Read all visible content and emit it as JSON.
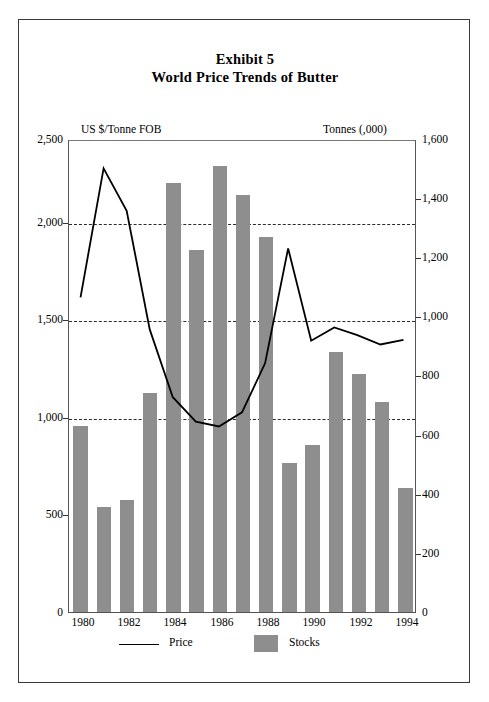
{
  "title": {
    "line1": "Exhibit 5",
    "line2": "World Price Trends of Butter"
  },
  "legend": {
    "price_label": "Price",
    "stocks_label": "Stocks"
  },
  "axes": {
    "left_title": "US $/Tonne FOB",
    "right_title": "Tonnes (,000)",
    "left_ticks": [
      "2,500",
      "2,000",
      "1,500",
      "1,000",
      "500",
      "0"
    ],
    "right_ticks": [
      "1,600",
      "1,400",
      "1,200",
      "1,000",
      "800",
      "600",
      "400",
      "200",
      "0"
    ],
    "x_ticks": [
      "1980",
      "1982",
      "1984",
      "1986",
      "1988",
      "1990",
      "1992",
      "1994"
    ]
  },
  "colors": {
    "bar_fill": "#8e8e8e",
    "line_stroke": "#000000",
    "grid": "#2b2b2b",
    "frame": "#3a3a3a"
  },
  "chart_data": {
    "type": "bar",
    "xlabel": "",
    "ylabel": "US $/Tonne FOB",
    "y2label": "Tonnes (,000)",
    "grid": true,
    "legend_position": "bottom",
    "categories": [
      1980,
      1981,
      1982,
      1983,
      1984,
      1985,
      1986,
      1987,
      1988,
      1989,
      1990,
      1991,
      1992,
      1993,
      1994
    ],
    "ylim": [
      0,
      2500
    ],
    "y2lim": [
      0,
      1600
    ],
    "y_ticks": [
      0,
      500,
      1000,
      1500,
      2000,
      2500
    ],
    "y2_ticks": [
      0,
      200,
      400,
      600,
      800,
      1000,
      1200,
      1400,
      1600
    ],
    "gridline_values": [
      1000,
      1500,
      2000
    ],
    "series": [
      {
        "name": "Stocks",
        "type": "bar",
        "axis": "right",
        "unit": "Tonnes (,000)",
        "values": [
          630,
          355,
          380,
          740,
          1450,
          1225,
          1510,
          1410,
          1270,
          505,
          565,
          880,
          805,
          710,
          420
        ]
      },
      {
        "name": "Price",
        "type": "line",
        "axis": "left",
        "unit": "US $/Tonne FOB",
        "values": [
          1670,
          2355,
          2130,
          1500,
          1140,
          1010,
          985,
          1060,
          1320,
          1930,
          1440,
          1510,
          1470,
          1420,
          1445
        ]
      }
    ]
  }
}
